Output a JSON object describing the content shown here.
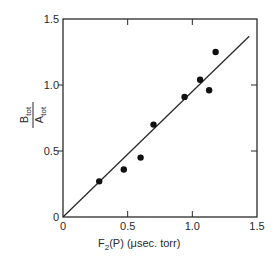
{
  "chart_data": {
    "type": "scatter",
    "title": "",
    "xlabel": "F2(P) (μsec. torr)",
    "xlabel_parts": {
      "main": "F",
      "sub": "2",
      "rest": "(P) (μsec. torr)"
    },
    "ylabel": "B_tot / A_tot",
    "ylabel_parts": {
      "numerator": "B",
      "numerator_sub": "tot",
      "denominator": "A",
      "denominator_sub": "tot"
    },
    "xlim": [
      0,
      1.5
    ],
    "ylim": [
      0,
      1.5
    ],
    "x_ticks": [
      0,
      0.5,
      1.0,
      1.5
    ],
    "x_tick_labels": [
      "0",
      "0.5",
      "1.0",
      "1.5"
    ],
    "y_ticks": [
      0,
      0.5,
      1.0,
      1.5
    ],
    "y_tick_labels": [
      "0",
      "0.5",
      "1.0",
      "1.5"
    ],
    "grid": false,
    "legend": null,
    "series": [
      {
        "name": "measurements",
        "type": "scatter",
        "marker": "filled-circle",
        "x": [
          0.28,
          0.47,
          0.6,
          0.7,
          0.94,
          1.06,
          1.13,
          1.18
        ],
        "y": [
          0.27,
          0.36,
          0.45,
          0.7,
          0.91,
          1.04,
          0.96,
          1.25
        ]
      },
      {
        "name": "linear fit",
        "type": "line",
        "x": [
          0,
          1.44
        ],
        "y": [
          0,
          1.37
        ]
      }
    ]
  },
  "colors": {
    "ink": "#2a2a2a",
    "background": "#ffffff"
  }
}
